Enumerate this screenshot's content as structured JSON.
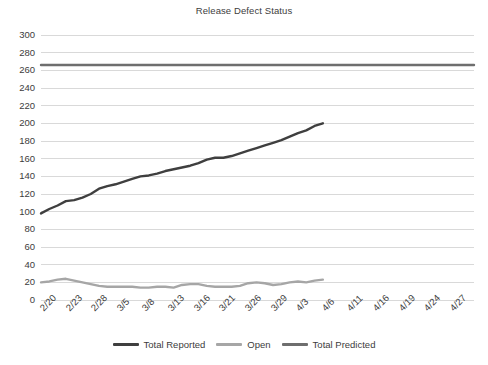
{
  "chart_data": {
    "type": "line",
    "title": "Release Defect Status",
    "xlabel": "",
    "ylabel": "",
    "ylim": [
      0,
      300
    ],
    "ytick_step": 20,
    "grid": true,
    "legend_position": "bottom",
    "categories": [
      "2/20",
      "2/21",
      "2/22",
      "2/23",
      "2/24",
      "2/27",
      "2/28",
      "3/1",
      "3/2",
      "3/3",
      "3/5",
      "3/6",
      "3/7",
      "3/8",
      "3/9",
      "3/12",
      "3/13",
      "3/14",
      "3/15",
      "3/16",
      "3/19",
      "3/20",
      "3/21",
      "3/22",
      "3/23",
      "3/26",
      "3/27",
      "3/28",
      "3/29",
      "3/30",
      "4/2",
      "4/3",
      "4/4",
      "4/5",
      "4/6"
    ],
    "xtick_labels": [
      "2/20",
      "2/23",
      "2/28",
      "3/5",
      "3/8",
      "3/13",
      "3/16",
      "3/21",
      "3/26",
      "3/29",
      "4/3",
      "4/6",
      "4/11",
      "4/16",
      "4/19",
      "4/24",
      "4/27"
    ],
    "xaxis_full_labels": [
      "2/20",
      "2/23",
      "2/28",
      "3/5",
      "3/8",
      "3/13",
      "3/16",
      "3/21",
      "3/26",
      "3/29",
      "4/3",
      "4/6",
      "4/11",
      "4/16",
      "4/19",
      "4/24",
      "4/27"
    ],
    "series": [
      {
        "name": "Total Reported",
        "color": "#3f3f3f",
        "values": [
          98,
          103,
          107,
          112,
          113,
          116,
          120,
          126,
          129,
          131,
          134,
          137,
          140,
          141,
          143,
          146,
          148,
          150,
          152,
          155,
          159,
          161,
          161,
          163,
          166,
          169,
          172,
          175,
          178,
          181,
          185,
          189,
          192,
          197,
          200
        ]
      },
      {
        "name": "Open",
        "color": "#a6a6a6",
        "values": [
          20,
          21,
          23,
          24,
          22,
          20,
          18,
          16,
          15,
          15,
          15,
          15,
          14,
          14,
          15,
          15,
          14,
          17,
          18,
          18,
          16,
          15,
          15,
          15,
          16,
          19,
          20,
          19,
          17,
          18,
          20,
          21,
          20,
          22,
          23
        ]
      },
      {
        "name": "Total Predicted",
        "color": "#6e6e6e",
        "values": [
          266,
          266,
          266,
          266,
          266,
          266,
          266,
          266,
          266,
          266,
          266,
          266,
          266,
          266,
          266,
          266,
          266,
          266,
          266,
          266,
          266,
          266,
          266,
          266,
          266,
          266,
          266,
          266,
          266,
          266,
          266,
          266,
          266,
          266,
          266
        ],
        "extends_full_width": true
      }
    ],
    "ytick_labels": [
      "300",
      "280",
      "260",
      "240",
      "220",
      "200",
      "180",
      "160",
      "140",
      "120",
      "100",
      "80",
      "60",
      "40",
      "20",
      "0"
    ],
    "gridline_color": "#d9d9d9",
    "background": "#ffffff"
  },
  "legend": {
    "entries": [
      {
        "label": "Total Reported",
        "color": "#3f3f3f"
      },
      {
        "label": "Open",
        "color": "#a6a6a6"
      },
      {
        "label": "Total Predicted",
        "color": "#6e6e6e"
      }
    ]
  }
}
